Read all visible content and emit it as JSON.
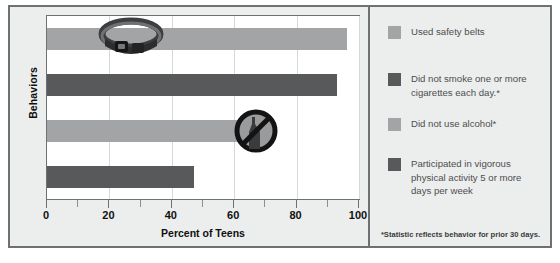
{
  "chart_data": {
    "type": "bar",
    "orientation": "horizontal",
    "title": "",
    "xlabel": "Percent of Teens",
    "ylabel": "Behaviors",
    "xlim": [
      0,
      100
    ],
    "xticks": [
      0,
      20,
      40,
      60,
      80,
      100
    ],
    "xtick_labels": [
      "0",
      "20",
      "40",
      "60",
      "80",
      "100"
    ],
    "grid": "vertical",
    "legend_position": "right",
    "categories": [
      "Used safety belts",
      "Did not smoke one or more cigarettes each day.*",
      "Did not use alcohol*",
      "Participated in vigorous physical activity 5 or more days per week"
    ],
    "values": [
      96,
      93,
      71,
      47
    ],
    "bar_colors": [
      "#a3a4a6",
      "#58595b",
      "#a3a4a6",
      "#58595b"
    ],
    "annotations": [
      "seatbelt-icon",
      "",
      "no-alcohol-icon",
      ""
    ],
    "footnote": "*Statistic reflects behavior for prior 30 days."
  },
  "axes": {
    "y_title": "Behaviors",
    "x_title": "Percent of Teens"
  },
  "legend": {
    "items": [
      {
        "label": "Used safety belts",
        "color": "#a3a4a6",
        "tone": "light"
      },
      {
        "label": "Did not smoke one or more cigarettes each day.*",
        "color": "#58595b",
        "tone": "dark"
      },
      {
        "label": "Did not use alcohol*",
        "color": "#a3a4a6",
        "tone": "light"
      },
      {
        "label": "Participated in vigorous physical activity 5 or more days per week",
        "color": "#58595b",
        "tone": "dark"
      }
    ]
  },
  "footnote": {
    "text": "*Statistic reflects behavior for prior 30 days."
  },
  "icons": {
    "seatbelt": "seatbelt-icon",
    "no_alcohol": "no-alcohol-icon"
  },
  "colors": {
    "light_bar": "#a3a4a6",
    "dark_bar": "#58595b",
    "frame": "#6e7173",
    "panel_bg": "#eceded",
    "plot_bg": "#ffffff",
    "gridline": "#d7d8da",
    "legend_text": "#4c4d4f"
  }
}
